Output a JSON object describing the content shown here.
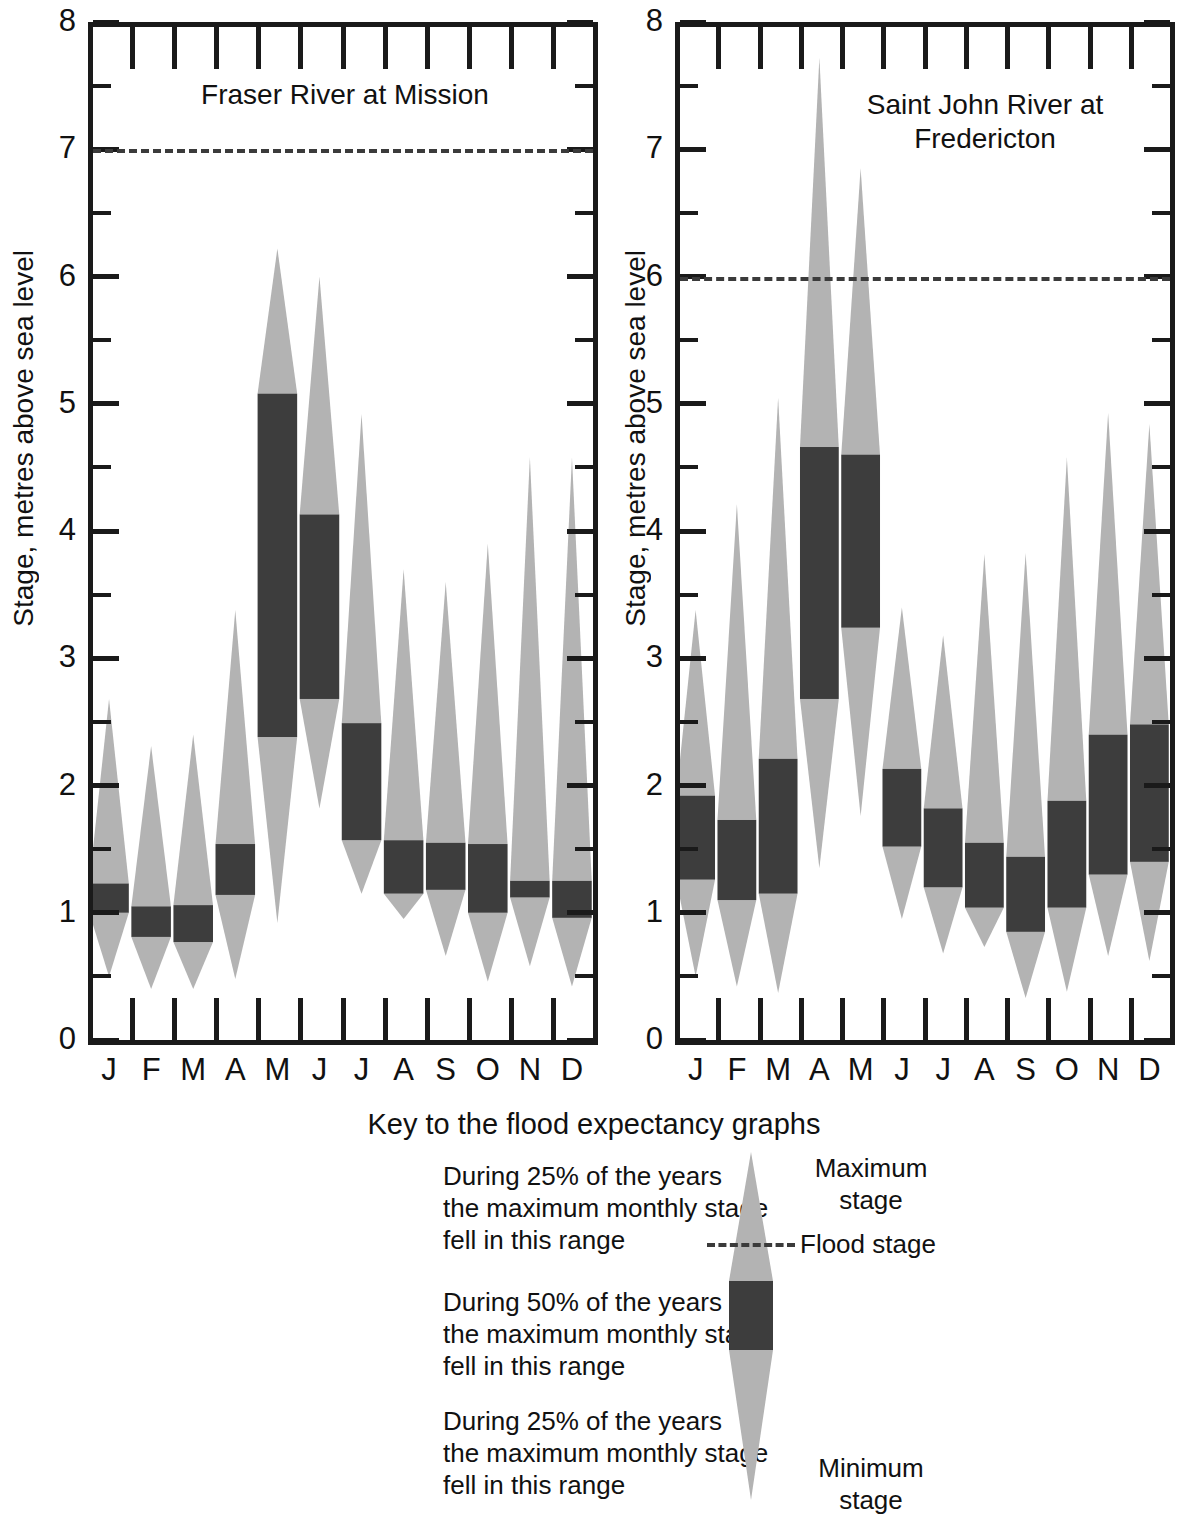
{
  "figure": {
    "y_axis_label": "Stage, metres above sea level",
    "y_ticks": [
      "0",
      "1",
      "2",
      "3",
      "4",
      "5",
      "6",
      "7",
      "8"
    ],
    "months": [
      "J",
      "F",
      "M",
      "A",
      "M",
      "J",
      "J",
      "A",
      "S",
      "O",
      "N",
      "D"
    ],
    "colors": {
      "light_band": "#b3b3b3",
      "dark_band": "#3d3d3d",
      "axis": "#1a1a1a",
      "flood_dash": "#3b3b3b",
      "background": "#ffffff"
    }
  },
  "key": {
    "title": "Key to the flood expectancy graphs",
    "upper_quartile_text": "During 25% of the years\nthe maximum monthly stage\nfell in this range",
    "interquartile_text": "During 50% of the years\nthe maximum monthly stage\nfell in this range",
    "lower_quartile_text": "During 25% of the years\nthe maximum monthly stage\nfell in this range",
    "maximum_label": "Maximum\nstage",
    "minimum_label": "Minimum\nstage",
    "flood_label": "Flood stage"
  },
  "chart_data": [
    {
      "type": "bar",
      "title": "Fraser River at Mission",
      "xlabel": "",
      "ylabel": "Stage, metres above sea level",
      "ylim": [
        0,
        8
      ],
      "ytick_step": 1,
      "minor_tick_step": 0.5,
      "grid": false,
      "flood_stage": 7.0,
      "categories": [
        "J",
        "F",
        "M",
        "A",
        "M",
        "J",
        "J",
        "A",
        "S",
        "O",
        "N",
        "D"
      ],
      "series": [
        {
          "name": "minimum",
          "values": [
            0.5,
            0.4,
            0.4,
            0.48,
            0.92,
            1.82,
            1.15,
            0.95,
            0.66,
            0.46,
            0.58,
            0.42
          ]
        },
        {
          "name": "q1",
          "values": [
            1.0,
            0.81,
            0.77,
            1.14,
            2.38,
            2.68,
            1.57,
            1.15,
            1.18,
            1.0,
            1.12,
            0.96
          ]
        },
        {
          "name": "q3",
          "values": [
            1.23,
            1.05,
            1.06,
            1.54,
            3.23,
            4.13,
            2.49,
            1.57,
            1.55,
            1.54,
            1.25,
            1.25
          ]
        },
        {
          "name": "maximum",
          "values": [
            2.68,
            2.31,
            2.4,
            3.38,
            6.22,
            6.0,
            4.92,
            3.7,
            3.6,
            3.9,
            4.58,
            4.58
          ]
        }
      ],
      "note_q3_special": {
        "M": 5.08,
        "J": 4.13
      }
    },
    {
      "type": "bar",
      "title": "Saint John River at\nFredericton",
      "xlabel": "",
      "ylabel": "Stage, metres above sea level",
      "ylim": [
        0,
        8
      ],
      "ytick_step": 1,
      "minor_tick_step": 0.5,
      "grid": false,
      "flood_stage": 6.0,
      "categories": [
        "J",
        "F",
        "M",
        "A",
        "M",
        "J",
        "J",
        "A",
        "S",
        "O",
        "N",
        "D"
      ],
      "series": [
        {
          "name": "minimum",
          "values": [
            0.5,
            0.42,
            0.37,
            1.35,
            1.76,
            0.95,
            0.68,
            0.73,
            0.33,
            0.38,
            0.66,
            0.62
          ]
        },
        {
          "name": "q1",
          "values": [
            1.26,
            1.1,
            1.15,
            2.68,
            3.24,
            1.52,
            1.2,
            1.04,
            0.85,
            1.04,
            1.3,
            1.4
          ]
        },
        {
          "name": "q3",
          "values": [
            1.92,
            1.73,
            2.21,
            4.66,
            4.6,
            2.13,
            1.82,
            1.55,
            1.44,
            1.88,
            2.4,
            2.48
          ]
        },
        {
          "name": "maximum",
          "values": [
            3.38,
            4.21,
            5.05,
            7.72,
            6.85,
            3.4,
            3.18,
            3.82,
            3.83,
            4.58,
            4.93,
            4.84
          ]
        }
      ]
    }
  ]
}
